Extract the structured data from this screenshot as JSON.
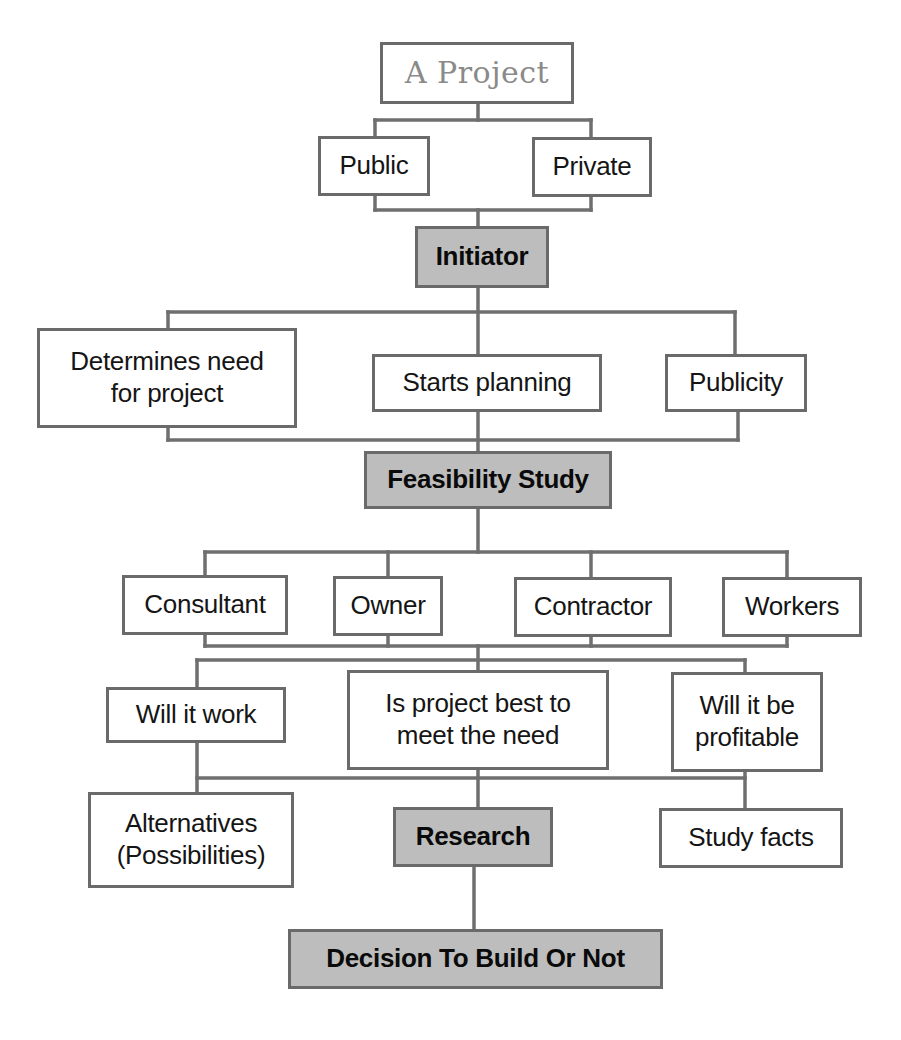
{
  "diagram": {
    "type": "flowchart",
    "title": "A Project",
    "colors": {
      "line": "#6f6f6f",
      "border": "#6a6a6a",
      "stage_fill": "#bdbdbd",
      "box_fill": "#ffffff",
      "root_text": "#8a8a8a",
      "text": "#151515"
    },
    "nodes": {
      "project": {
        "label": "A Project",
        "kind": "root"
      },
      "public": {
        "label": "Public",
        "kind": "option"
      },
      "private": {
        "label": "Private",
        "kind": "option"
      },
      "initiator": {
        "label": "Initiator",
        "kind": "stage"
      },
      "determines_need": {
        "label": "Determines need\nfor project",
        "kind": "task"
      },
      "starts_planning": {
        "label": "Starts planning",
        "kind": "task"
      },
      "publicity": {
        "label": "Publicity",
        "kind": "task"
      },
      "feasibility_study": {
        "label": "Feasibility Study",
        "kind": "stage"
      },
      "consultant": {
        "label": "Consultant",
        "kind": "participant"
      },
      "owner": {
        "label": "Owner",
        "kind": "participant"
      },
      "contractor": {
        "label": "Contractor",
        "kind": "participant"
      },
      "workers": {
        "label": "Workers",
        "kind": "participant"
      },
      "will_it_work": {
        "label": "Will it work",
        "kind": "question"
      },
      "is_project_best": {
        "label": "Is project best to\nmeet the need",
        "kind": "question"
      },
      "will_it_be_profitable": {
        "label": "Will it be\nprofitable",
        "kind": "question"
      },
      "alternatives": {
        "label": "Alternatives\n(Possibilities)",
        "kind": "task"
      },
      "research": {
        "label": "Research",
        "kind": "stage"
      },
      "study_facts": {
        "label": "Study facts",
        "kind": "task"
      },
      "decision": {
        "label": "Decision To Build Or Not",
        "kind": "stage"
      }
    },
    "edges": [
      [
        "project",
        "public"
      ],
      [
        "project",
        "private"
      ],
      [
        "public",
        "initiator"
      ],
      [
        "private",
        "initiator"
      ],
      [
        "initiator",
        "determines_need"
      ],
      [
        "initiator",
        "starts_planning"
      ],
      [
        "initiator",
        "publicity"
      ],
      [
        "determines_need",
        "feasibility_study"
      ],
      [
        "starts_planning",
        "feasibility_study"
      ],
      [
        "publicity",
        "feasibility_study"
      ],
      [
        "feasibility_study",
        "consultant"
      ],
      [
        "feasibility_study",
        "owner"
      ],
      [
        "feasibility_study",
        "contractor"
      ],
      [
        "feasibility_study",
        "workers"
      ],
      [
        "consultant",
        "will_it_work"
      ],
      [
        "owner",
        "is_project_best"
      ],
      [
        "contractor",
        "is_project_best"
      ],
      [
        "workers",
        "will_it_be_profitable"
      ],
      [
        "will_it_work",
        "alternatives"
      ],
      [
        "is_project_best",
        "research"
      ],
      [
        "will_it_be_profitable",
        "study_facts"
      ],
      [
        "research",
        "decision"
      ]
    ]
  }
}
